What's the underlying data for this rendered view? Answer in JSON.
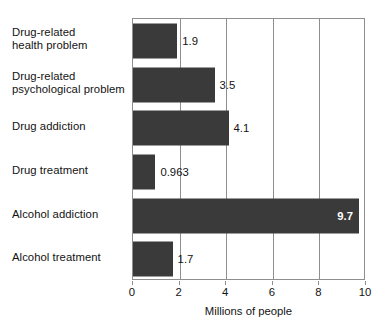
{
  "chart_data": {
    "type": "bar",
    "orientation": "horizontal",
    "title": "",
    "subtitle": "",
    "xlabel": "Millions of people",
    "ylabel": "",
    "categories": [
      "Drug-related health problem",
      "Drug-related psychological problem",
      "Drug addiction",
      "Drug treatment",
      "Alcohol addiction",
      "Alcohol treatment"
    ],
    "category_lines": [
      [
        "Drug-related",
        "health problem"
      ],
      [
        "Drug-related",
        "psychological problem"
      ],
      [
        "Drug addiction"
      ],
      [
        "Drug treatment"
      ],
      [
        "Alcohol addiction"
      ],
      [
        "Alcohol treatment"
      ]
    ],
    "values": [
      1.9,
      3.5,
      4.1,
      0.963,
      9.7,
      1.7
    ],
    "value_labels": [
      "1.9",
      "3.5",
      "4.1",
      "0.963",
      "9.7",
      "1.7"
    ],
    "label_placement": [
      "outside",
      "outside",
      "outside",
      "outside",
      "inside",
      "outside"
    ],
    "xlim": [
      0,
      10
    ],
    "xticks": [
      0,
      2,
      4,
      6,
      8,
      10
    ],
    "xtick_labels": [
      "0",
      "2",
      "4",
      "6",
      "8",
      "10"
    ],
    "gridlines_x": [
      2,
      4,
      6,
      8
    ],
    "grid": true,
    "legend": false,
    "legend_position": "none",
    "colors": {
      "bar": "#3a3a3a",
      "axis": "#8e8e8e",
      "grid": "#8e8e8e",
      "text": "#131313",
      "inside_label": "#ffffff",
      "background": "#ffffff"
    }
  }
}
